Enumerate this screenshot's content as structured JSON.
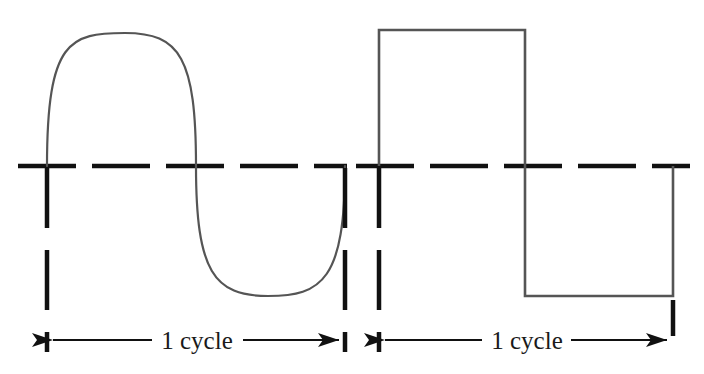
{
  "figure": {
    "name": "waveform-cycle-comparison",
    "background_color": "#ffffff",
    "axis_color": "#111111",
    "wave_color": "#555555",
    "text_color": "#1a1a1a"
  },
  "panels": [
    {
      "id": "sine-panel",
      "waveform_type": "sine",
      "cycle_label": "1 cycle",
      "baseline_y": 166,
      "cycle_start_x": 47,
      "cycle_end_x": 345,
      "peak": {
        "x": 125,
        "y": 33
      },
      "trough": {
        "x": 268,
        "y": 296
      },
      "amplitude": 133,
      "period": 298
    },
    {
      "id": "square-panel",
      "waveform_type": "square",
      "cycle_label": "1 cycle",
      "baseline_y": 166,
      "cycle_start_x": 379,
      "cycle_end_x": 673,
      "top_y": 30,
      "bottom_y": 296,
      "transition_x": 525,
      "amplitude": 136,
      "period": 294
    }
  ],
  "baseline": {
    "label": "zero-reference-dashed-line",
    "y": 166,
    "left_segment": {
      "start_x": 18,
      "end_x": 345
    },
    "right_segment": {
      "start_x": 356,
      "end_x": 688
    },
    "dash_length": 58,
    "dash_gap": 16
  },
  "dimension_lines": [
    {
      "id": "sine-dimension",
      "y": 340,
      "left_tick_x": 47,
      "right_tick_x": 345,
      "arrow_direction": "both",
      "label": "1 cycle"
    },
    {
      "id": "square-dimension",
      "y": 340,
      "left_tick_x": 379,
      "right_tick_x": 673,
      "arrow_direction": "both",
      "label": "1 cycle"
    }
  ],
  "labels": {
    "sine_cycle": "1 cycle",
    "square_cycle": "1 cycle"
  }
}
